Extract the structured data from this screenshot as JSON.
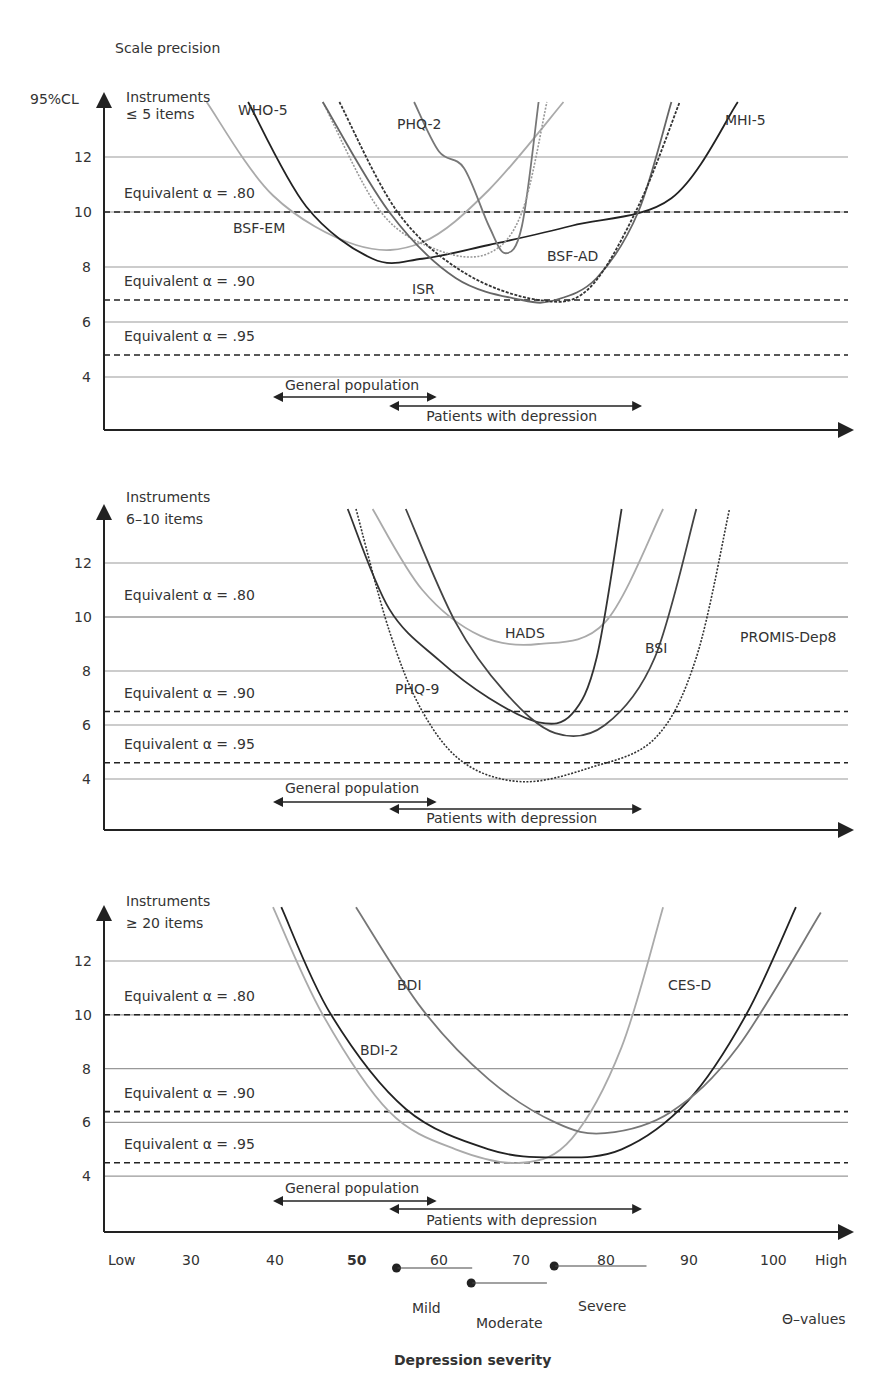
{
  "figure": {
    "title": "Scale precision",
    "y_axis_label": "95%CL",
    "x_axis_title": "Depression severity",
    "x_axis_unit_label": "Θ–values",
    "x_ticks": [
      "Low",
      "30",
      "40",
      "50",
      "60",
      "70",
      "80",
      "90",
      "100",
      "High"
    ],
    "severity_bands": [
      {
        "label": "Mild",
        "start": 55,
        "end": 64
      },
      {
        "label": "Moderate",
        "start": 64,
        "end": 73
      },
      {
        "label": "Severe",
        "start": 74,
        "end": 85
      }
    ],
    "population_ranges": [
      {
        "label": "General population",
        "start": 40,
        "end": 59
      },
      {
        "label": "Patients with depression",
        "start": 54,
        "end": 84
      }
    ]
  },
  "chart_data": [
    {
      "type": "line",
      "title": "Instruments ≤ 5 items",
      "panel_label_line1": "Instruments",
      "panel_label_line2": "≤ 5 items",
      "xlabel": "Depression severity (Θ-values)",
      "ylabel": "95%CL",
      "xlim": [
        22,
        110
      ],
      "ylim": [
        2,
        14
      ],
      "y_ticks": [
        4,
        6,
        8,
        10,
        12
      ],
      "grid": true,
      "reference_lines": [
        {
          "label": "Equivalent α = .80",
          "y": 10.0,
          "style": "dashed"
        },
        {
          "label": "Equivalent α = .90",
          "y": 6.8,
          "style": "dashed"
        },
        {
          "label": "Equivalent α = .95",
          "y": 4.8,
          "style": "dashed"
        }
      ],
      "series": [
        {
          "name": "BSF-EM",
          "color": "#aaaaaa",
          "style": "solid",
          "x": [
            32,
            40,
            50,
            58,
            66,
            75
          ],
          "y": [
            14,
            10.6,
            8.8,
            8.9,
            10.8,
            14
          ]
        },
        {
          "name": "WHO-5",
          "color": "#222222",
          "style": "solid",
          "x": [
            37,
            44,
            52,
            58,
            66,
            76,
            88,
            96
          ],
          "y": [
            14,
            10.2,
            8.3,
            8.3,
            8.8,
            9.5,
            10.5,
            14
          ]
        },
        {
          "name": "PHQ-2",
          "color": "#777777",
          "style": "solid",
          "x": [
            57,
            60,
            63,
            66,
            68,
            70,
            72
          ],
          "y": [
            14,
            12.2,
            11.6,
            9.5,
            8.5,
            9.5,
            14
          ]
        },
        {
          "name": "BSF-AD",
          "color": "#999999",
          "style": "dotted",
          "x": [
            46,
            53,
            60,
            66,
            70,
            73
          ],
          "y": [
            14,
            10.0,
            8.6,
            8.5,
            10.0,
            14
          ]
        },
        {
          "name": "ISR",
          "color": "#666666",
          "style": "solid",
          "x": [
            46,
            54,
            62,
            70,
            74,
            79,
            84,
            88
          ],
          "y": [
            14,
            10.0,
            7.6,
            6.8,
            6.8,
            7.6,
            10.0,
            14
          ]
        },
        {
          "name": "MHI-5",
          "color": "#333333",
          "style": "dashed-dark",
          "x": [
            48,
            55,
            63,
            72,
            78,
            84,
            89
          ],
          "y": [
            14,
            10.0,
            7.8,
            6.8,
            7.2,
            10.2,
            14
          ]
        }
      ],
      "labels": [
        "WHO-5",
        "PHQ-2",
        "MHI-5",
        "BSF-EM",
        "BSF-AD",
        "ISR"
      ]
    },
    {
      "type": "line",
      "title": "Instruments 6–10 items",
      "panel_label_line1": "Instruments",
      "panel_label_line2": "6–10 items",
      "xlabel": "Depression severity (Θ-values)",
      "ylabel": "95%CL",
      "xlim": [
        22,
        110
      ],
      "ylim": [
        2,
        14
      ],
      "y_ticks": [
        4,
        6,
        8,
        10,
        12
      ],
      "grid": true,
      "reference_lines": [
        {
          "label": "Equivalent α = .80",
          "y": 10.0,
          "style": "solid"
        },
        {
          "label": "Equivalent α = .90",
          "y": 6.5,
          "style": "dashed"
        },
        {
          "label": "Equivalent α = .95",
          "y": 4.6,
          "style": "dashed"
        }
      ],
      "series": [
        {
          "name": "HADS",
          "color": "#aaaaaa",
          "style": "solid",
          "x": [
            52,
            58,
            65,
            72,
            80,
            87
          ],
          "y": [
            14,
            11.0,
            9.3,
            9.0,
            9.8,
            14
          ]
        },
        {
          "name": "PHQ-9",
          "color": "#333333",
          "style": "solid",
          "x": [
            49,
            54,
            60,
            66,
            72,
            76,
            79,
            82
          ],
          "y": [
            14,
            10.3,
            8.4,
            7.0,
            6.1,
            6.4,
            8.5,
            14
          ]
        },
        {
          "name": "BSI",
          "color": "#444444",
          "style": "solid",
          "x": [
            56,
            62,
            68,
            74,
            80,
            86,
            91
          ],
          "y": [
            14,
            9.8,
            7.2,
            5.7,
            6.0,
            8.5,
            14
          ]
        },
        {
          "name": "PROMIS-Dep8",
          "color": "#333333",
          "style": "dotted",
          "x": [
            50,
            54,
            58,
            63,
            70,
            78,
            86,
            91,
            95
          ],
          "y": [
            14,
            9.5,
            6.5,
            4.6,
            3.9,
            4.4,
            5.5,
            8.5,
            14
          ]
        }
      ],
      "labels": [
        "HADS",
        "BSI",
        "PROMIS-Dep8",
        "PHQ-9"
      ]
    },
    {
      "type": "line",
      "title": "Instruments ≥ 20 items",
      "panel_label_line1": "Instruments",
      "panel_label_line2": "≥ 20 items",
      "xlabel": "Depression severity (Θ-values)",
      "ylabel": "95%CL",
      "xlim": [
        22,
        110
      ],
      "ylim": [
        2,
        14
      ],
      "y_ticks": [
        4,
        6,
        8,
        10,
        12
      ],
      "grid": true,
      "reference_lines": [
        {
          "label": "Equivalent α = .80",
          "y": 10.0,
          "style": "dashed"
        },
        {
          "label": "Equivalent α = .90",
          "y": 6.4,
          "style": "dashed"
        },
        {
          "label": "Equivalent α = .95",
          "y": 4.5,
          "style": "dashed"
        }
      ],
      "series": [
        {
          "name": "CES-D",
          "color": "#aaaaaa",
          "style": "solid",
          "x": [
            40,
            46,
            54,
            62,
            70,
            76,
            82,
            87
          ],
          "y": [
            14,
            10.0,
            6.4,
            5.0,
            4.5,
            5.4,
            8.8,
            14
          ]
        },
        {
          "name": "BDI-2",
          "color": "#222222",
          "style": "solid",
          "x": [
            41,
            47,
            56,
            66,
            74,
            82,
            90,
            97,
            103
          ],
          "y": [
            14,
            10.0,
            6.5,
            5.0,
            4.7,
            5.0,
            6.8,
            10.0,
            14
          ]
        },
        {
          "name": "BDI",
          "color": "#777777",
          "style": "solid",
          "x": [
            50,
            58,
            66,
            74,
            80,
            88,
            96,
            106
          ],
          "y": [
            14,
            10.2,
            7.6,
            6.0,
            5.6,
            6.4,
            8.8,
            13.8
          ]
        }
      ],
      "labels": [
        "BDI",
        "CES-D",
        "BDI-2"
      ]
    }
  ]
}
